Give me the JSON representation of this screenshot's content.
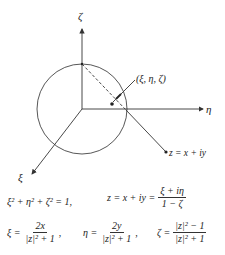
{
  "diagram": {
    "axes": {
      "zeta_label": "ζ",
      "eta_label": "η",
      "xi_label": "ξ"
    },
    "point_label": "(ξ, η, ζ)",
    "plane_point_label": "z = x + iy",
    "colors": {
      "line": "#333333",
      "text": "#222222",
      "background": "#ffffff"
    }
  },
  "equations": {
    "line1_left": "ξ² + η² + ζ² = 1,",
    "line1_right_lhs": "z = x + iy =",
    "line1_right_num": "ξ + iη",
    "line1_right_den": "1 − ζ",
    "xi_lhs": "ξ =",
    "xi_num": "2x",
    "xi_den": "|z|² + 1",
    "eta_lhs": "η =",
    "eta_num": "2y",
    "eta_den": "|z|² + 1",
    "zeta_lhs": "ζ =",
    "zeta_num": "|z|² − 1",
    "zeta_den": "|z|² + 1",
    "comma": ","
  }
}
